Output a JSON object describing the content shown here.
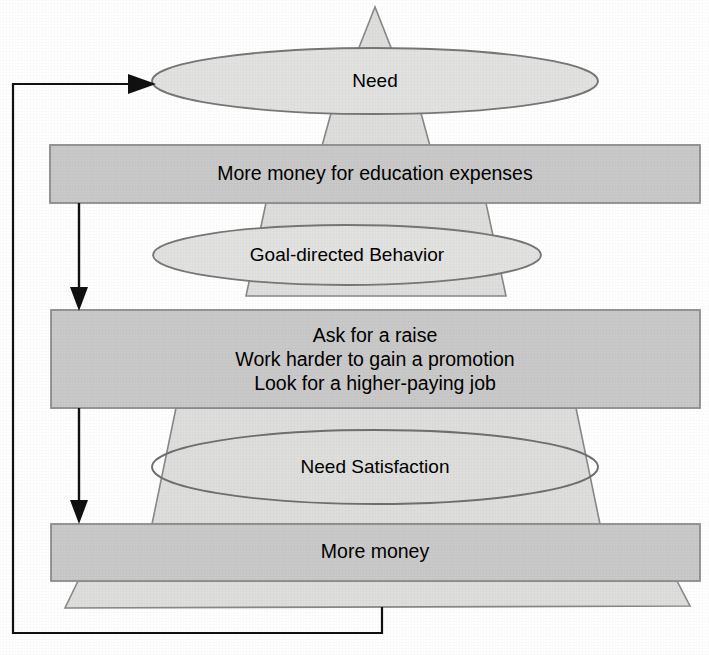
{
  "diagram": {
    "type": "pyramid-flow-with-feedback-loop",
    "background_color": "#ffffff",
    "colors": {
      "pyramid_fill": "#dededd",
      "ellipse_fill": "#e2e2e1",
      "bar_fill": "#c9c9c9",
      "outline": "#888888",
      "arrow": "#111111",
      "text": "#000000"
    },
    "stages": [
      {
        "id": "need",
        "label": "Need",
        "shape": "ellipse",
        "example": {
          "id": "need-example",
          "label": "More money for education expenses",
          "shape": "bar",
          "lines": [
            "More money for education expenses"
          ]
        }
      },
      {
        "id": "goal-directed-behavior",
        "label": "Goal-directed Behavior",
        "shape": "ellipse",
        "example": {
          "id": "goal-directed-behavior-example",
          "label": "Ask for a raise / Work harder to gain a promotion / Look for a higher-paying job",
          "shape": "bar",
          "lines": [
            "Ask for a raise",
            "Work harder to gain a promotion",
            "Look for a higher-paying job"
          ]
        }
      },
      {
        "id": "need-satisfaction",
        "label": "Need Satisfaction",
        "shape": "ellipse",
        "example": {
          "id": "need-satisfaction-example",
          "label": "More money",
          "shape": "bar",
          "lines": [
            "More money"
          ]
        }
      }
    ],
    "connectors": [
      {
        "id": "flow-need-to-behavior",
        "from": "need-example",
        "to": "goal-directed-behavior-example",
        "style": "arrow-down"
      },
      {
        "id": "flow-behavior-to-satisfaction",
        "from": "goal-directed-behavior-example",
        "to": "need-satisfaction-example",
        "style": "arrow-down"
      },
      {
        "id": "feedback-loop",
        "from": "need-satisfaction-base",
        "to": "need",
        "style": "arrow-left-up-right",
        "description": "Feedback loop from the satisfied need back to the Need stage"
      }
    ]
  }
}
